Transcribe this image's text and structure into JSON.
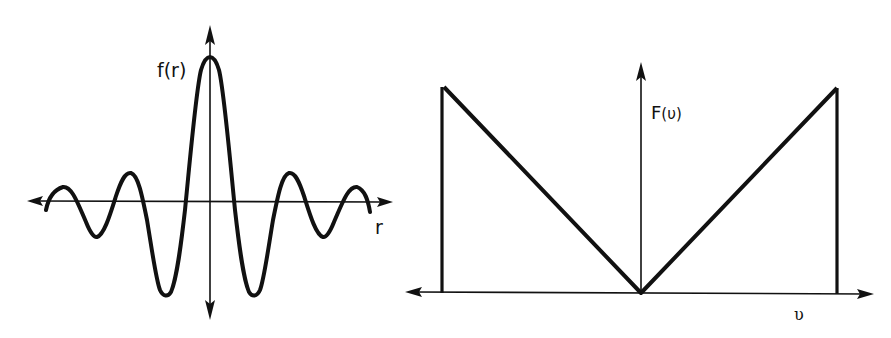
{
  "figure": {
    "background": "#ffffff",
    "ink_color": "#111111",
    "panels": [
      {
        "id": "spatial-domain",
        "function_label": "f(r)",
        "axis_label": "r",
        "description": "Damped oscillating (sinc-like) function centered on the vertical axis"
      },
      {
        "id": "frequency-domain",
        "function_label_main": "F",
        "function_label_arg": "(υ)",
        "axis_label": "υ",
        "description": "V-shaped (ramp) function, zero at origin, truncated by vertical lines at both ends"
      }
    ]
  },
  "left_plot": {
    "y_label": "f(r)",
    "x_label": "r",
    "curve_points": [
      [
        46,
        210
      ],
      [
        50,
        196
      ],
      [
        56,
        189
      ],
      [
        63,
        187
      ],
      [
        70,
        190
      ],
      [
        78,
        205
      ],
      [
        88,
        227
      ],
      [
        96,
        237
      ],
      [
        103,
        232
      ],
      [
        112,
        210
      ],
      [
        121,
        183
      ],
      [
        130,
        173
      ],
      [
        137,
        178
      ],
      [
        144,
        200
      ],
      [
        151,
        240
      ],
      [
        157,
        275
      ],
      [
        166,
        295
      ],
      [
        173,
        288
      ],
      [
        180,
        245
      ],
      [
        186,
        201
      ],
      [
        192,
        140
      ],
      [
        198,
        90
      ],
      [
        204,
        62
      ],
      [
        210,
        57
      ],
      [
        216,
        62
      ],
      [
        222,
        90
      ],
      [
        227,
        140
      ],
      [
        232,
        201
      ],
      [
        238,
        245
      ],
      [
        244,
        288
      ],
      [
        250,
        295
      ],
      [
        258,
        275
      ],
      [
        264,
        240
      ],
      [
        271,
        205
      ],
      [
        279,
        180
      ],
      [
        288,
        174
      ],
      [
        296,
        180
      ],
      [
        304,
        205
      ],
      [
        312,
        227
      ],
      [
        320,
        237
      ],
      [
        328,
        230
      ],
      [
        337,
        208
      ],
      [
        346,
        192
      ],
      [
        354,
        189
      ],
      [
        361,
        193
      ],
      [
        367,
        204
      ],
      [
        370,
        212
      ]
    ]
  },
  "right_plot": {
    "y_label_main": "F",
    "y_label_arg": "(υ)",
    "x_label": "υ",
    "v_shape_points": [
      [
        444,
        87
      ],
      [
        641,
        293
      ],
      [
        837,
        88
      ]
    ],
    "left_cutoff_x": 442,
    "right_cutoff_x": 837,
    "baseline_y": 293
  }
}
